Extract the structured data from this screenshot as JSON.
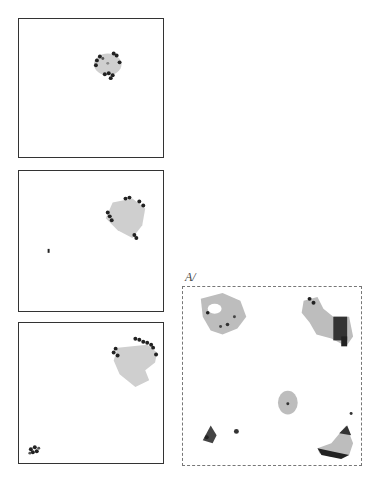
{
  "figure": {
    "colors": {
      "border": "#333333",
      "dashed_border": "#777777",
      "cluster_fill": "#c8c8c8",
      "cluster_edge": "#222222",
      "background": "#ffffff"
    },
    "panels": [
      {
        "id": "panel-1",
        "style": "solid",
        "box": [
          18,
          18,
          146,
          140
        ],
        "clusters": [
          {
            "cx": 0.62,
            "cy": 0.33,
            "r": 0.09,
            "kind": "mixed"
          }
        ]
      },
      {
        "id": "panel-2",
        "style": "solid",
        "box": [
          18,
          170,
          146,
          142
        ],
        "clusters": [
          {
            "cx": 0.72,
            "cy": 0.3,
            "r": 0.12,
            "kind": "mixed"
          },
          {
            "cx": 0.2,
            "cy": 0.57,
            "r": 0.015,
            "kind": "dark"
          }
        ]
      },
      {
        "id": "panel-3",
        "style": "solid",
        "box": [
          18,
          322,
          146,
          142
        ],
        "clusters": [
          {
            "cx": 0.78,
            "cy": 0.25,
            "r": 0.15,
            "kind": "mixed"
          },
          {
            "cx": 0.12,
            "cy": 0.93,
            "r": 0.04,
            "kind": "dark"
          }
        ]
      },
      {
        "id": "panel-4",
        "style": "dashed",
        "box": [
          182,
          286,
          180,
          180
        ],
        "label": "A/",
        "clusters": [
          {
            "cx": 0.22,
            "cy": 0.18,
            "r": 0.14,
            "kind": "light-hole"
          },
          {
            "cx": 0.8,
            "cy": 0.25,
            "r": 0.15,
            "kind": "mixed"
          },
          {
            "cx": 0.6,
            "cy": 0.62,
            "r": 0.06,
            "kind": "light"
          },
          {
            "cx": 0.14,
            "cy": 0.83,
            "r": 0.04,
            "kind": "dark"
          },
          {
            "cx": 0.3,
            "cy": 0.81,
            "r": 0.015,
            "kind": "dark"
          },
          {
            "cx": 0.86,
            "cy": 0.92,
            "r": 0.12,
            "kind": "mixed"
          }
        ]
      }
    ]
  }
}
